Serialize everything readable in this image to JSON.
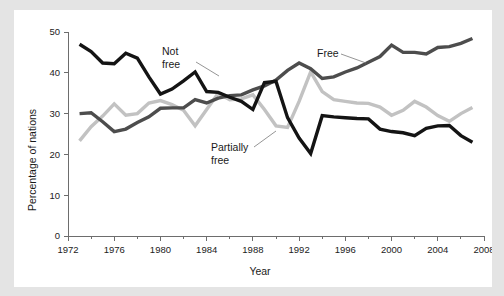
{
  "figure": {
    "background_color": "#e4e4e4",
    "card_color": "#ffffff"
  },
  "chart_data": {
    "type": "line",
    "title": "",
    "xlabel": "Year",
    "ylabel": "Percentage of nations",
    "xlim": [
      1972,
      2008
    ],
    "ylim": [
      0,
      50
    ],
    "xticks": [
      1972,
      1976,
      1980,
      1984,
      1988,
      1992,
      1996,
      2000,
      2004,
      2008
    ],
    "xtick_labels": [
      "1972",
      "1976",
      "1980",
      "1984",
      "1988",
      "1992",
      "1996",
      "2000",
      "2004",
      "2008"
    ],
    "xminor_ticks": [
      1974,
      1978,
      1982,
      1986,
      1990,
      1994,
      1998,
      2002,
      2006
    ],
    "yticks": [
      0,
      10,
      20,
      30,
      40,
      50
    ],
    "ytick_labels": [
      "0",
      "10",
      "20",
      "30",
      "40",
      "50"
    ],
    "grid": false,
    "legend": "inline-annotations",
    "x": [
      1973,
      1974,
      1975,
      1976,
      1977,
      1978,
      1979,
      1980,
      1981,
      1982,
      1983,
      1984,
      1985,
      1986,
      1987,
      1988,
      1989,
      1990,
      1991,
      1992,
      1993,
      1994,
      1995,
      1996,
      1997,
      1998,
      1999,
      2000,
      2001,
      2002,
      2003,
      2004,
      2005,
      2006,
      2007
    ],
    "series": [
      {
        "name": "Not free",
        "color": "#141414",
        "values": [
          47.0,
          45.2,
          42.4,
          42.2,
          44.8,
          43.6,
          39.0,
          34.8,
          36.0,
          38.0,
          40.2,
          35.4,
          35.2,
          34.0,
          33.0,
          31.0,
          37.6,
          37.9,
          29.0,
          24.0,
          20.2,
          29.5,
          29.2,
          29.0,
          28.8,
          28.7,
          26.2,
          25.6,
          25.3,
          24.6,
          26.4,
          27.0,
          27.1,
          24.6,
          23.0
        ]
      },
      {
        "name": "Partially free",
        "color": "#c2c2c2",
        "values": [
          23.3,
          26.8,
          29.4,
          32.4,
          29.6,
          30.0,
          32.6,
          33.2,
          32.2,
          30.8,
          27.0,
          31.0,
          35.0,
          33.4,
          33.6,
          34.6,
          31.0,
          27.0,
          26.6,
          33.0,
          40.2,
          35.4,
          33.4,
          33.0,
          32.6,
          32.5,
          31.6,
          29.6,
          30.8,
          33.0,
          31.6,
          29.5,
          28.1,
          30.0,
          31.5
        ]
      },
      {
        "name": "Free",
        "color": "#4d4d4d",
        "values": [
          30.0,
          30.2,
          28.0,
          25.6,
          26.2,
          27.8,
          29.2,
          31.3,
          31.4,
          31.4,
          33.4,
          32.6,
          33.8,
          34.4,
          34.6,
          35.8,
          36.8,
          38.2,
          40.6,
          42.4,
          41.0,
          38.6,
          39.0,
          40.2,
          41.2,
          42.6,
          44.0,
          46.8,
          45.0,
          45.0,
          44.6,
          46.2,
          46.4,
          47.2,
          48.4
        ]
      }
    ],
    "annotations": [
      {
        "name": "not-free",
        "label_line1": "Not",
        "label_line2": "free",
        "label_x": 148,
        "label_y": 45,
        "leader": [
          [
            182,
            52
          ],
          [
            205,
            66
          ]
        ],
        "target_series": "Not free"
      },
      {
        "name": "partially-free",
        "label_line1": "Partially",
        "label_line2": "free",
        "label_x": 197,
        "label_y": 141,
        "leader": [
          [
            240,
            137
          ],
          [
            262,
            121
          ]
        ],
        "target_series": "Partially free"
      },
      {
        "name": "free",
        "label_line1": "Free",
        "label_line2": "",
        "label_x": 303,
        "label_y": 47,
        "leader": [
          [
            327,
            44
          ],
          [
            352,
            53
          ]
        ],
        "target_series": "Free"
      }
    ]
  }
}
